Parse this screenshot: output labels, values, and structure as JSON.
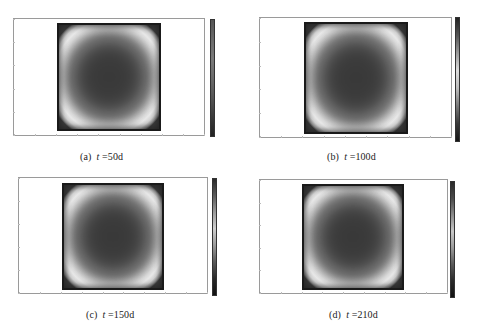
{
  "figure": {
    "panels": [
      {
        "id": "a",
        "label": "(a)",
        "var": "t",
        "eq": "=50d",
        "caption": "(a)  t =50d"
      },
      {
        "id": "b",
        "label": "(b)",
        "var": "t",
        "eq": "=100d",
        "caption": "(b)  t =100d"
      },
      {
        "id": "c",
        "label": "(c)",
        "var": "t",
        "eq": "=150d",
        "caption": "(c)  t =150d"
      },
      {
        "id": "d",
        "label": "(d)",
        "var": "t",
        "eq": "=210d",
        "caption": "(d)  t =210d"
      }
    ]
  },
  "colors": {
    "frame": "#9a9a9a",
    "heatmap_edge": "#1e1e1e",
    "heatmap_ring": "#e8e8e8",
    "heatmap_center": "#3a3a3a"
  },
  "chart_data": [
    {
      "type": "heatmap",
      "title": "(a) t=50d",
      "colormap": "grayscale",
      "pattern": "rounded-square field: dark boundary, bright ring near edges, dark center",
      "time_days": 50,
      "xlabel": "",
      "ylabel": "",
      "grid": false,
      "legend_position": "right colorbar",
      "colorbar_gradient": [
        "#555555",
        "#6a6a6a",
        "#7a7a7a",
        "#6a6a6a",
        "#555555",
        "#3a3a3a",
        "#222222"
      ]
    },
    {
      "type": "heatmap",
      "title": "(b) t=100d",
      "colormap": "grayscale",
      "pattern": "rounded-square field: dark boundary, bright ring near edges, dark center",
      "time_days": 100,
      "xlabel": "",
      "ylabel": "",
      "grid": false,
      "legend_position": "right colorbar",
      "colorbar_gradient": [
        "#222222",
        "#555555",
        "#9a9a9a",
        "#dcdcdc",
        "#bdbdbd",
        "#7a7a7a",
        "#3a3a3a",
        "#151515"
      ]
    },
    {
      "type": "heatmap",
      "title": "(c) t=150d",
      "colormap": "grayscale",
      "pattern": "rounded-square field: dark boundary, bright ring near edges, dark center",
      "time_days": 150,
      "xlabel": "",
      "ylabel": "",
      "grid": false,
      "legend_position": "right colorbar",
      "colorbar_gradient": [
        "#2a2a2a",
        "#5a5a5a",
        "#9a9a9a",
        "#cfcfcf",
        "#9a9a9a",
        "#5a5a5a",
        "#2a2a2a",
        "#111111"
      ]
    },
    {
      "type": "heatmap",
      "title": "(d) t=210d",
      "colormap": "grayscale",
      "pattern": "rounded-square field: dark boundary, bright ring near edges, dark center",
      "time_days": 210,
      "xlabel": "",
      "ylabel": "",
      "grid": false,
      "legend_position": "right colorbar",
      "colorbar_gradient": [
        "#2a2a2a",
        "#4a4a4a",
        "#8a8a8a",
        "#c8c8c8",
        "#9a9a9a",
        "#5a5a5a",
        "#2a2a2a",
        "#111111"
      ]
    }
  ]
}
